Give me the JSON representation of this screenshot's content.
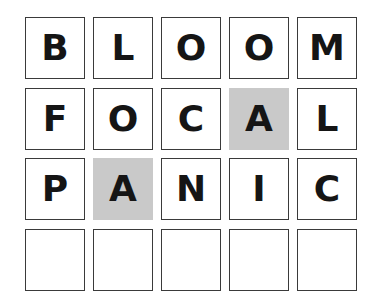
{
  "board": {
    "rows": [
      {
        "word": "BLOOM",
        "cells": [
          {
            "letter": "B",
            "state": "absent"
          },
          {
            "letter": "L",
            "state": "absent"
          },
          {
            "letter": "O",
            "state": "absent"
          },
          {
            "letter": "O",
            "state": "absent"
          },
          {
            "letter": "M",
            "state": "absent"
          }
        ]
      },
      {
        "word": "FOCAL",
        "cells": [
          {
            "letter": "F",
            "state": "absent"
          },
          {
            "letter": "O",
            "state": "absent"
          },
          {
            "letter": "C",
            "state": "absent"
          },
          {
            "letter": "A",
            "state": "present"
          },
          {
            "letter": "L",
            "state": "absent"
          }
        ]
      },
      {
        "word": "PANIC",
        "cells": [
          {
            "letter": "P",
            "state": "absent"
          },
          {
            "letter": "A",
            "state": "present"
          },
          {
            "letter": "N",
            "state": "absent"
          },
          {
            "letter": "I",
            "state": "absent"
          },
          {
            "letter": "C",
            "state": "absent"
          }
        ]
      },
      {
        "word": "",
        "cells": [
          {
            "letter": "",
            "state": "empty"
          },
          {
            "letter": "",
            "state": "empty"
          },
          {
            "letter": "",
            "state": "empty"
          },
          {
            "letter": "",
            "state": "empty"
          },
          {
            "letter": "",
            "state": "empty"
          }
        ]
      }
    ]
  },
  "colors": {
    "present_fill": "#c9c9c9",
    "border": "#3a3a3a",
    "letter": "#151515",
    "background": "#ffffff"
  }
}
